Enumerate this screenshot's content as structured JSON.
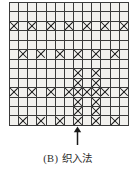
{
  "figure": {
    "caption_label": "(B)",
    "caption_text": "织入法",
    "arrow": {
      "name": "up-arrow-indicator",
      "points_to_column": 8,
      "direction": "up"
    },
    "colors": {
      "cell_fill": "#f2f1ee",
      "cell_black": "#0c0c0c",
      "grid_line": "#3a3a3a",
      "mark_stroke": "#161616",
      "caption": "#2b2b2b",
      "background": "#ffffff"
    }
  },
  "chart_data": {
    "type": "heatmap",
    "xlabel": "",
    "ylabel": "",
    "rows": 13,
    "columns": 13,
    "legend": [
      {
        "symbol": "black",
        "label": "填充格"
      },
      {
        "symbol": "cross",
        "label": "交叉格"
      },
      {
        "symbol": "empty",
        "label": "空白格"
      }
    ],
    "cell_codes": {
      "0": "empty",
      "1": "black",
      "2": "cross"
    },
    "grid": [
      [
        0,
        0,
        0,
        0,
        0,
        0,
        1,
        0,
        0,
        0,
        0,
        0,
        1
      ],
      [
        0,
        0,
        0,
        0,
        0,
        1,
        0,
        0,
        0,
        0,
        0,
        1,
        0
      ],
      [
        2,
        0,
        2,
        0,
        2,
        0,
        2,
        0,
        2,
        0,
        2,
        0,
        2
      ],
      [
        0,
        0,
        0,
        0,
        0,
        1,
        0,
        0,
        0,
        0,
        0,
        1,
        0
      ],
      [
        0,
        0,
        0,
        0,
        0,
        0,
        1,
        0,
        0,
        0,
        0,
        0,
        1
      ],
      [
        0,
        2,
        0,
        2,
        0,
        2,
        0,
        2,
        0,
        2,
        0,
        2,
        0
      ],
      [
        0,
        0,
        0,
        0,
        0,
        0,
        1,
        0,
        0,
        0,
        0,
        0,
        1
      ],
      [
        0,
        0,
        0,
        0,
        0,
        1,
        0,
        2,
        0,
        2,
        0,
        1,
        0
      ],
      [
        0,
        0,
        0,
        0,
        0,
        0,
        1,
        2,
        0,
        2,
        1,
        0,
        0
      ],
      [
        2,
        0,
        2,
        0,
        2,
        0,
        2,
        2,
        2,
        2,
        2,
        0,
        2
      ],
      [
        0,
        0,
        0,
        0,
        0,
        0,
        1,
        2,
        0,
        2,
        1,
        0,
        0
      ],
      [
        0,
        0,
        0,
        0,
        0,
        1,
        0,
        2,
        0,
        2,
        0,
        1,
        0
      ],
      [
        0,
        2,
        0,
        2,
        0,
        2,
        0,
        2,
        0,
        2,
        0,
        2,
        0
      ]
    ]
  }
}
